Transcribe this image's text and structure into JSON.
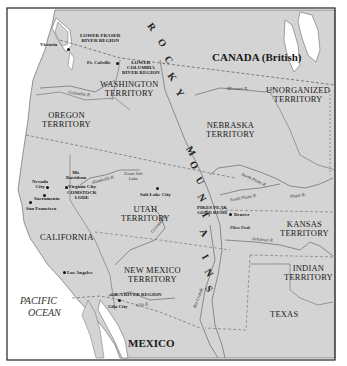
{
  "map": {
    "colors": {
      "land": "#d4d4d4",
      "water": "#ffffff",
      "border": "#555555",
      "frame": "#222222",
      "text": "#1a1a1a"
    },
    "countries": {
      "canada": "CANADA (British)",
      "mexico": "MEXICO"
    },
    "ocean": {
      "line1": "PACIFIC",
      "line2": "OCEAN"
    },
    "mountains": [
      "R",
      "O",
      "C",
      "K",
      "Y",
      "M",
      "O",
      "U",
      "N",
      "T",
      "A",
      "I",
      "N",
      "S"
    ],
    "territories": {
      "washington": [
        "WASHINGTON",
        "TERRITORY"
      ],
      "oregon": [
        "OREGON",
        "TERRITORY"
      ],
      "nebraska": [
        "NEBRASKA",
        "TERRITORY"
      ],
      "unorganized": [
        "UNORGANIZED",
        "TERRITORY"
      ],
      "utah": [
        "UTAH",
        "TERRITORY"
      ],
      "california": "CALIFORNIA",
      "kansas": [
        "KANSAS",
        "TERRITORY"
      ],
      "new_mexico": [
        "NEW MEXICO",
        "TERRITORY"
      ],
      "indian": [
        "INDIAN",
        "TERRITORY"
      ],
      "texas": "TEXAS"
    },
    "regions": {
      "lower_fraser": [
        "LOWER FRASER",
        "RIVER REGION"
      ],
      "lower_columbia": [
        "LOWER",
        "COLUMBIA",
        "RIVER REGION"
      ],
      "comstock": [
        "COMSTOCK",
        "LODE"
      ],
      "pikes_peak": [
        "PIKES PEAK",
        "GOLD RUSH"
      ],
      "gila": "GILA RIVER REGION"
    },
    "cities": {
      "victoria": "Victoria",
      "ft_colville": "Ft. Colville",
      "nevada_city": [
        "Nevada",
        "City"
      ],
      "mt_davidson": [
        "Mt.",
        "Davidson"
      ],
      "virginia_city": "Virginia City",
      "sacramento": "Sacramento",
      "san_francisco": "San Francisco",
      "salt_lake_city": "Salt Lake City",
      "great_salt_lake": [
        "Great Salt",
        "Lake"
      ],
      "denver": "Denver",
      "pikes_peak": "Pikes Peak",
      "los_angeles": "Los Angeles",
      "gila_city": "Gila City"
    },
    "rivers": {
      "columbia": "Columbia R.",
      "missouri": "Missouri R.",
      "humboldt": "Humboldt R.",
      "north_platte": "North Platte R.",
      "south_platte": "South Platte R.",
      "platte": "Platte R.",
      "colorado": "Colorado R.",
      "arkansas": "Arkansas R.",
      "rio_grande": "Rio Grande",
      "gila": "Gila R."
    }
  }
}
